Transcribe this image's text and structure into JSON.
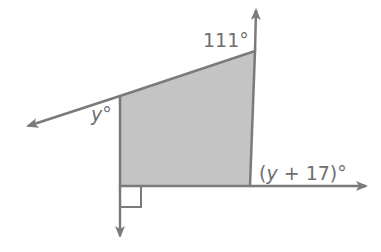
{
  "diagram": {
    "type": "quadrilateral-exterior-angles",
    "colors": {
      "line": "#7a7a7a",
      "fill": "#c4c4c4",
      "text": "#6e6e6e",
      "background": "#ffffff"
    },
    "labels": {
      "top_right_angle": "111°",
      "left_angle_var": "y",
      "left_angle_deg": "°",
      "bottom_right_open": "(",
      "bottom_right_var": "y",
      "bottom_right_rest": " + 17)°"
    },
    "marks": {
      "right_angle": "bottom-left vertex"
    }
  }
}
